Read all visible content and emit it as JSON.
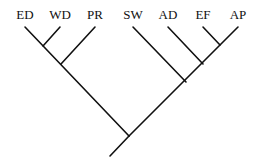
{
  "diagram": {
    "type": "cladogram",
    "taxa": [
      "ED",
      "WD",
      "PR",
      "SW",
      "AD",
      "EF",
      "AP"
    ],
    "labels": [
      {
        "id": "ED",
        "text": "ED",
        "x": 25,
        "y": 19
      },
      {
        "id": "WD",
        "text": "WD",
        "x": 60,
        "y": 19
      },
      {
        "id": "PR",
        "text": "PR",
        "x": 95,
        "y": 19
      },
      {
        "id": "SW",
        "text": "SW",
        "x": 133,
        "y": 19
      },
      {
        "id": "AD",
        "text": "AD",
        "x": 168,
        "y": 19
      },
      {
        "id": "EF",
        "text": "EF",
        "x": 203,
        "y": 19
      },
      {
        "id": "AP",
        "text": "AP",
        "x": 238,
        "y": 19
      }
    ],
    "topology": "(((ED,WD),PR),(SW,(AD,(EF,AP))))",
    "stroke_color": "#111111",
    "background": "#ffffff"
  }
}
